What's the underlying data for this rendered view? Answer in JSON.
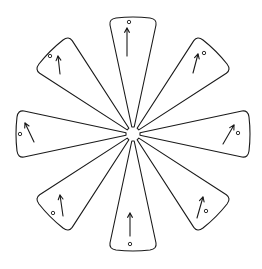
{
  "diagram": {
    "center": [
      133,
      134
    ],
    "colors": {
      "stroke": "#1a1a1a",
      "fill": "#ffffff",
      "background": "#ffffff"
    },
    "petals": [
      {
        "name": "top",
        "angle": 0,
        "circle": [
          129,
          22
        ],
        "arrow": {
          "from": [
            127,
            56
          ],
          "to": [
            127,
            28
          ]
        }
      },
      {
        "name": "top-right",
        "angle": 45,
        "circle": [
          204,
          53
        ],
        "arrow": {
          "from": [
            193,
            73
          ],
          "to": [
            198,
            54
          ]
        }
      },
      {
        "name": "right",
        "angle": 90,
        "circle": [
          238,
          133
        ],
        "arrow": {
          "from": [
            223,
            144
          ],
          "to": [
            234,
            125
          ]
        }
      },
      {
        "name": "bottom-right",
        "angle": 135,
        "circle": [
          206,
          211
        ],
        "arrow": {
          "from": [
            197,
            218
          ],
          "to": [
            203,
            197
          ]
        }
      },
      {
        "name": "bottom",
        "angle": 180,
        "circle": [
          130,
          244
        ],
        "arrow": {
          "from": [
            130,
            236
          ],
          "to": [
            130,
            213
          ]
        }
      },
      {
        "name": "bottom-left",
        "angle": 225,
        "circle": [
          53,
          213
        ],
        "arrow": {
          "from": [
            63,
            216
          ],
          "to": [
            60,
            195
          ]
        }
      },
      {
        "name": "left",
        "angle": 270,
        "circle": [
          20,
          134
        ],
        "arrow": {
          "from": [
            34,
            142
          ],
          "to": [
            25,
            123
          ]
        }
      },
      {
        "name": "top-left",
        "angle": 315,
        "circle": [
          50,
          56
        ],
        "arrow": {
          "from": [
            60,
            74
          ],
          "to": [
            58,
            56
          ]
        }
      }
    ]
  }
}
